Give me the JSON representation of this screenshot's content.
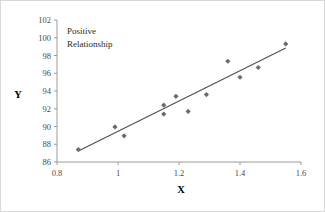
{
  "chart_data": {
    "type": "scatter",
    "title": "",
    "xlabel": "X",
    "ylabel": "Y",
    "xlim": [
      0.8,
      1.6
    ],
    "ylim": [
      86,
      102
    ],
    "xticks": [
      "0.8",
      "1",
      "1.2",
      "1.4",
      "1.6"
    ],
    "xtick_values": [
      0.8,
      1.0,
      1.2,
      1.4,
      1.6
    ],
    "yticks": [
      "86",
      "88",
      "90",
      "92",
      "94",
      "96",
      "98",
      "100",
      "102"
    ],
    "ytick_values": [
      86,
      88,
      90,
      92,
      94,
      96,
      98,
      100,
      102
    ],
    "grid": false,
    "legend": "none",
    "annotations": [
      {
        "text_line1": "Positive",
        "text_line2": "Relationship",
        "x": 0.89,
        "y": 100.2
      }
    ],
    "series": [
      {
        "name": "observations",
        "marker": "diamond",
        "color": "#6b6b6b",
        "points": [
          {
            "x": 0.87,
            "y": 87.4
          },
          {
            "x": 0.99,
            "y": 89.95
          },
          {
            "x": 1.02,
            "y": 88.95
          },
          {
            "x": 1.15,
            "y": 92.4
          },
          {
            "x": 1.15,
            "y": 91.4
          },
          {
            "x": 1.19,
            "y": 93.4
          },
          {
            "x": 1.23,
            "y": 91.7
          },
          {
            "x": 1.29,
            "y": 93.6
          },
          {
            "x": 1.36,
            "y": 97.35
          },
          {
            "x": 1.4,
            "y": 95.55
          },
          {
            "x": 1.46,
            "y": 96.65
          },
          {
            "x": 1.55,
            "y": 99.3
          }
        ]
      },
      {
        "name": "trendline",
        "type": "line",
        "color": "#4f4f4f",
        "points": [
          {
            "x": 0.87,
            "y": 87.25
          },
          {
            "x": 1.55,
            "y": 98.85
          }
        ]
      }
    ],
    "colors": {
      "marker": "#6b6b6b",
      "trendline": "#4f4f4f",
      "axis": "#9a9a9a",
      "tick_label": "#4a4a4a",
      "border": "#d9d9d9",
      "background": "#ffffff"
    }
  }
}
